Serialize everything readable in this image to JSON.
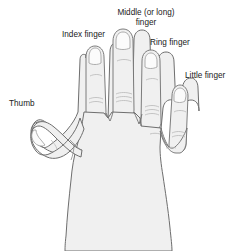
{
  "figure": {
    "background_color": "#ffffff",
    "hand_fill_color": "#f0f0f0",
    "hand_outline_color": "#6e6e6e",
    "detail_line_color": "#a8a8a8",
    "label_text_color": "#1a1a1a"
  },
  "labels": {
    "thumb": "Thumb",
    "index": "Index finger",
    "middle_line1": "Middle (or long)",
    "middle_line2": "finger",
    "ring": "Ring finger",
    "little": "Little finger"
  }
}
